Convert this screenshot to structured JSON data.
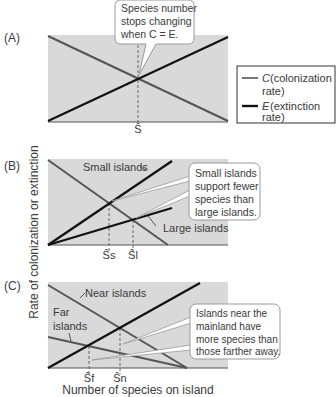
{
  "figure": {
    "y_axis_label": "Rate of colonization or extinction",
    "x_axis_label": "Number of species on island",
    "colors": {
      "panel_bg": "#d9d9d9",
      "colonization_line": "#555555",
      "extinction_line": "#111111",
      "callout_border": "#9a9a9a",
      "callout_bg": "#ffffff"
    }
  },
  "panels": [
    {
      "label": "(A)",
      "callout": [
        "Species number",
        "stops changing",
        "when C = E."
      ],
      "equilibrium_labels": [
        "Ŝ"
      ],
      "legend": [
        {
          "symbol": "C",
          "line1": " (colonization",
          "line2": "rate)",
          "style": "gray-line"
        },
        {
          "symbol": "E",
          "line1": " (extinction",
          "line2": "rate)",
          "style": "black-line"
        }
      ]
    },
    {
      "label": "(B)",
      "line_labels": [
        "Small islands",
        "Large islands"
      ],
      "callout": [
        "Small islands",
        "support fewer",
        "species than",
        "large islands."
      ],
      "equilibrium_labels": [
        "Ŝs",
        "Ŝl"
      ]
    },
    {
      "label": "(C)",
      "line_labels": [
        "Near islands",
        "Far",
        "islands"
      ],
      "callout": [
        "Islands near the",
        "mainland have",
        "more species than",
        "those farther away."
      ],
      "equilibrium_labels": [
        "Ŝf",
        "Ŝn"
      ]
    }
  ]
}
